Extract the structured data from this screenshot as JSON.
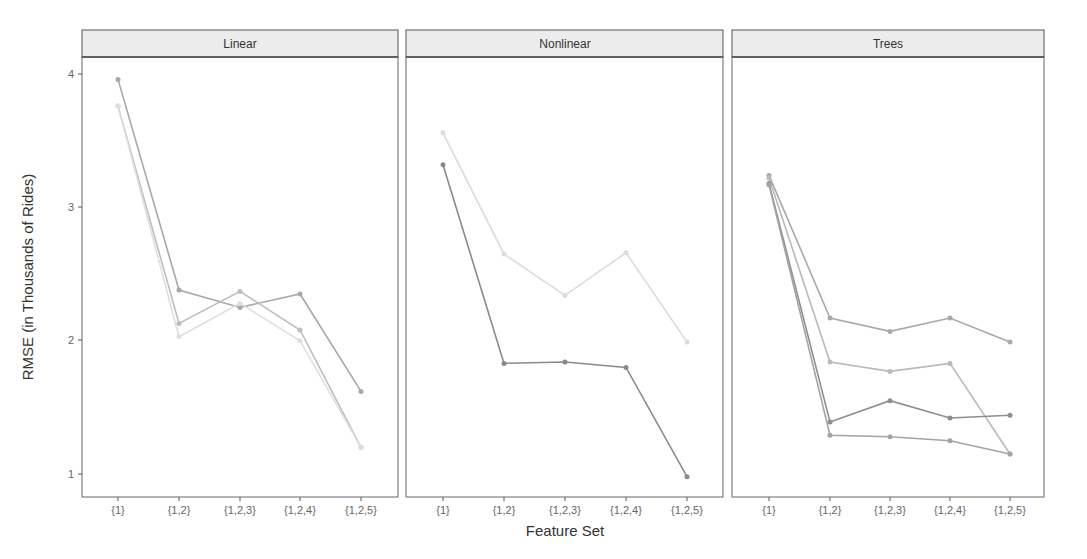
{
  "chart_data": {
    "type": "line",
    "title": "",
    "xlabel": "Feature Set",
    "ylabel": "RMSE (in Thousands of Rides)",
    "ylim": [
      0.82,
      4.12
    ],
    "y_ticks": [
      1,
      2,
      3,
      4
    ],
    "categories": [
      "{1}",
      "{1,2}",
      "{1,2,3}",
      "{1,2,4}",
      "{1,2,5}"
    ],
    "grid": false,
    "legend": "none",
    "facets": [
      {
        "label": "Linear",
        "series": [
          {
            "name": "linear-model-a",
            "color": "#a8a8a8",
            "values": [
              3.96,
              2.38,
              2.25,
              2.35,
              1.62
            ]
          },
          {
            "name": "linear-model-b",
            "color": "#bdbdbd",
            "values": [
              3.76,
              2.13,
              2.37,
              2.08,
              1.2
            ]
          },
          {
            "name": "linear-model-c",
            "color": "#dedede",
            "values": [
              3.76,
              2.03,
              2.28,
              2.0,
              1.2
            ]
          }
        ]
      },
      {
        "label": "Nonlinear",
        "series": [
          {
            "name": "nonlinear-model-a",
            "color": "#dcdcdc",
            "values": [
              3.56,
              2.65,
              2.34,
              2.66,
              1.99
            ]
          },
          {
            "name": "nonlinear-model-b",
            "color": "#8a8a8a",
            "values": [
              3.32,
              1.83,
              1.84,
              1.8,
              0.98
            ]
          }
        ]
      },
      {
        "label": "Trees",
        "series": [
          {
            "name": "trees-model-a",
            "color": "#a9a9a9",
            "values": [
              3.24,
              2.17,
              2.07,
              2.17,
              1.99
            ]
          },
          {
            "name": "trees-model-b",
            "color": "#bababa",
            "values": [
              3.22,
              1.84,
              1.77,
              1.83,
              1.15
            ]
          },
          {
            "name": "trees-model-c",
            "color": "#8e8e8e",
            "values": [
              3.18,
              1.39,
              1.55,
              1.42,
              1.44
            ]
          },
          {
            "name": "trees-model-d",
            "color": "#a4a4a4",
            "values": [
              3.17,
              1.29,
              1.28,
              1.25,
              1.15
            ]
          }
        ]
      }
    ]
  },
  "labels": {
    "facet_1": "Linear",
    "facet_2": "Nonlinear",
    "facet_3": "Trees",
    "xlabel": "Feature Set",
    "ylabel": "RMSE (in Thousands of Rides)",
    "yticks": [
      "1",
      "2",
      "3",
      "4"
    ],
    "xticks": [
      "{1}",
      "{1,2}",
      "{1,2,3}",
      "{1,2,4}",
      "{1,2,5}"
    ]
  }
}
